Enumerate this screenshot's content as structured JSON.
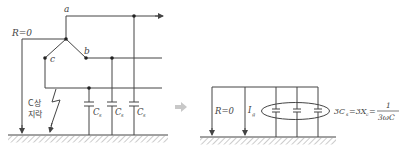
{
  "left_diagram": {
    "node_labels": {
      "a": "a",
      "b": "b",
      "c": "c"
    },
    "resistor_label": "R=0",
    "fault_label_line1": "C상",
    "fault_label_line2": "지락",
    "capacitor_labels": [
      {
        "main": "C",
        "sub": "s"
      },
      {
        "main": "C",
        "sub": "s"
      },
      {
        "main": "C",
        "sub": "s"
      }
    ]
  },
  "transition_arrow": "⇒",
  "right_diagram": {
    "resistor_label": "R=0",
    "current_label": {
      "main": "I",
      "sub": "g"
    },
    "equation": {
      "lhs_main": "3C",
      "lhs_sub": "s",
      "mid": "=3X",
      "mid_sub": "c",
      "eq": "=",
      "numerator": "1",
      "denominator": "3ωC"
    }
  },
  "colors": {
    "line": "#444444",
    "hatch": "#9a9a9a",
    "arrow_gray": "#c8c8c8"
  }
}
